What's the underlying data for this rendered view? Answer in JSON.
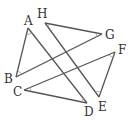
{
  "diagram": {
    "type": "geometry",
    "points": [
      {
        "name": "A",
        "x": 28,
        "y": 28,
        "lx": 24,
        "ly": 25
      },
      {
        "name": "H",
        "x": 45,
        "y": 23,
        "lx": 37,
        "ly": 18
      },
      {
        "name": "G",
        "x": 102,
        "y": 34,
        "lx": 106,
        "ly": 39
      },
      {
        "name": "F",
        "x": 115,
        "y": 52,
        "lx": 118,
        "ly": 54
      },
      {
        "name": "B",
        "x": 16,
        "y": 77,
        "lx": 3,
        "ly": 83
      },
      {
        "name": "C",
        "x": 24,
        "y": 90,
        "lx": 13,
        "ly": 96
      },
      {
        "name": "D",
        "x": 87,
        "y": 103,
        "lx": 85,
        "ly": 116
      },
      {
        "name": "E",
        "x": 99,
        "y": 97,
        "lx": 98,
        "ly": 111
      }
    ],
    "segments": [
      [
        "A",
        "B"
      ],
      [
        "A",
        "D"
      ],
      [
        "B",
        "G"
      ],
      [
        "H",
        "G"
      ],
      [
        "H",
        "E"
      ],
      [
        "E",
        "F"
      ],
      [
        "F",
        "C"
      ],
      [
        "C",
        "D"
      ]
    ],
    "angle_marks": [
      "A",
      "B",
      "C",
      "D",
      "E",
      "F",
      "G",
      "H"
    ],
    "colors": {
      "line": "#555555",
      "label": "#333333",
      "arc": "#999999"
    }
  }
}
